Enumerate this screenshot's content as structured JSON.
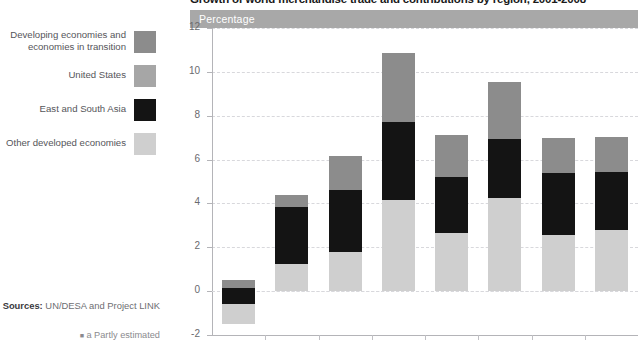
{
  "header": {
    "title": "Growth of world merchandise trade and contributions by region, 2001-2008",
    "unit_band_label": "Percentage"
  },
  "legend": {
    "items": [
      {
        "label": "Developing economies and economies in transition",
        "color": "#8c8c8c",
        "key": "developing"
      },
      {
        "label": "United States",
        "color": "#a6a6a6",
        "key": "united-states"
      },
      {
        "label": "East and South Asia",
        "color": "#141414",
        "key": "east-south-asia"
      },
      {
        "label": "Other developed economies",
        "color": "#cfcfcf",
        "key": "other-developed"
      }
    ]
  },
  "sources": {
    "label": "Sources:",
    "text": "UN/DESA and Project LINK",
    "footnote": "a Partly estimated"
  },
  "chart_data": {
    "type": "bar",
    "stacked": true,
    "title": "Growth of world merchandise trade and contributions by region, 2001-2008",
    "xlabel": "",
    "ylabel": "Percentage",
    "ylim": [
      -2,
      12
    ],
    "ytick_values": [
      -2,
      0,
      2,
      4,
      6,
      8,
      10,
      12
    ],
    "ytick_labels": [
      "-2",
      "0",
      "2",
      "4",
      "6",
      "8",
      "10",
      "12"
    ],
    "grid": true,
    "legend_position": "left",
    "categories": [
      "2001",
      "2002",
      "2003",
      "2004",
      "2005",
      "2006",
      "2007",
      "2008"
    ],
    "series": [
      {
        "name": "Other developed economies",
        "color": "#cfcfcf",
        "values": [
          -1.5,
          1.25,
          1.8,
          4.15,
          2.65,
          4.25,
          2.55,
          2.8
        ]
      },
      {
        "name": "East and South Asia",
        "color": "#141414",
        "values": [
          0.7,
          2.6,
          2.65,
          3.55,
          2.5,
          2.7,
          2.85,
          2.65
        ]
      },
      {
        "name": "United States",
        "color": "#a6a6a6",
        "values": [
          0.0,
          0.0,
          0.0,
          0.0,
          0.0,
          0.0,
          0.0,
          0.0
        ]
      },
      {
        "name": "Developing economies and economies in transition",
        "color": "#8c8c8c",
        "values": [
          0.55,
          0.55,
          1.55,
          3.15,
          1.9,
          2.6,
          1.6,
          1.6
        ]
      }
    ],
    "totals": [
      -0.25,
      4.4,
      6.0,
      10.85,
      7.05,
      9.55,
      7.0,
      7.05
    ],
    "bars": [
      {
        "category": "2001",
        "top": 0.5,
        "segments": [
          {
            "key": "developing",
            "from": 0.15,
            "to": 0.5
          },
          {
            "key": "east-south-asia",
            "from": -0.57,
            "to": 0.15
          },
          {
            "key": "other-developed",
            "from": -1.5,
            "to": -0.57
          }
        ]
      },
      {
        "category": "2002",
        "top": 4.4,
        "segments": [
          {
            "key": "developing",
            "from": 3.85,
            "to": 4.4
          },
          {
            "key": "east-south-asia",
            "from": 1.25,
            "to": 3.85
          },
          {
            "key": "other-developed",
            "from": 0,
            "to": 1.25
          }
        ]
      },
      {
        "category": "2003",
        "top": 6.15,
        "segments": [
          {
            "key": "developing",
            "from": 4.6,
            "to": 6.15
          },
          {
            "key": "east-south-asia",
            "from": 1.8,
            "to": 4.6
          },
          {
            "key": "other-developed",
            "from": 0,
            "to": 1.8
          }
        ]
      },
      {
        "category": "2004",
        "top": 10.85,
        "segments": [
          {
            "key": "developing",
            "from": 7.7,
            "to": 10.85
          },
          {
            "key": "east-south-asia",
            "from": 4.15,
            "to": 7.7
          },
          {
            "key": "other-developed",
            "from": 0,
            "to": 4.15
          }
        ]
      },
      {
        "category": "2005",
        "top": 7.1,
        "segments": [
          {
            "key": "developing",
            "from": 5.2,
            "to": 7.1
          },
          {
            "key": "east-south-asia",
            "from": 2.65,
            "to": 5.2
          },
          {
            "key": "other-developed",
            "from": 0,
            "to": 2.65
          }
        ]
      },
      {
        "category": "2006",
        "top": 9.55,
        "segments": [
          {
            "key": "developing",
            "from": 6.95,
            "to": 9.55
          },
          {
            "key": "east-south-asia",
            "from": 4.25,
            "to": 6.95
          },
          {
            "key": "other-developed",
            "from": 0,
            "to": 4.25
          }
        ]
      },
      {
        "category": "2007",
        "top": 7.0,
        "segments": [
          {
            "key": "developing",
            "from": 5.4,
            "to": 7.0
          },
          {
            "key": "east-south-asia",
            "from": 2.55,
            "to": 5.4
          },
          {
            "key": "other-developed",
            "from": 0,
            "to": 2.55
          }
        ]
      },
      {
        "category": "2008",
        "top": 7.05,
        "segments": [
          {
            "key": "developing",
            "from": 5.45,
            "to": 7.05
          },
          {
            "key": "east-south-asia",
            "from": 2.8,
            "to": 5.45
          },
          {
            "key": "other-developed",
            "from": 0,
            "to": 2.8
          }
        ]
      }
    ]
  }
}
